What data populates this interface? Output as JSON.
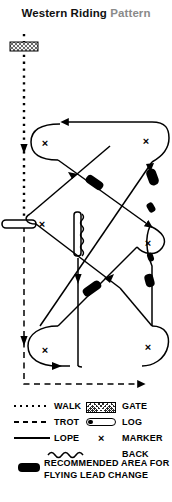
{
  "title": {
    "main": "Western Riding",
    "sub": "Pattern"
  },
  "diagram": {
    "name": "western-riding-pattern-diagram",
    "obstacles": {
      "gate": "gate",
      "log_horizontal": "log",
      "log_vertical": "log"
    },
    "markers_count": 6,
    "lead_change_bars_count": 6
  },
  "legend": {
    "gait_items": [
      {
        "symbol": "walk-line",
        "label": "WALK"
      },
      {
        "symbol": "trot-line",
        "label": "TROT"
      },
      {
        "symbol": "lope-line",
        "label": "LOPE"
      }
    ],
    "object_items": [
      {
        "symbol": "gate-swatch",
        "label": "GATE"
      },
      {
        "symbol": "log-swatch",
        "label": "LOG"
      },
      {
        "symbol": "marker-swatch",
        "label": "MARKER"
      },
      {
        "symbol": "back-swatch",
        "label": "BACK"
      }
    ],
    "marker_glyph": "×",
    "recommended": {
      "line1": "RECOMMENDED AREA FOR",
      "line2": "FLYING LEAD CHANGE"
    }
  },
  "colors": {
    "ink": "#000000",
    "title_main": "#111111",
    "title_sub": "#8a8a8a",
    "background": "#ffffff"
  }
}
